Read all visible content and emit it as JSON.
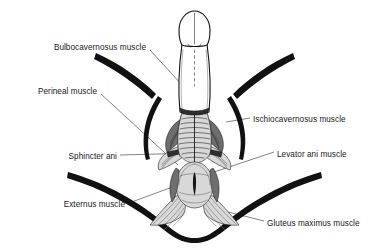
{
  "figure": {
    "background_color": "#ffffff",
    "ink_color": "#111111",
    "leader_color": "#2b2b2b",
    "width": 389,
    "height": 248
  },
  "labels": {
    "bulbocavernosus": "Bulbocavernosus muscle",
    "perineal": "Perineal muscle",
    "sphincter_ani": "Sphincter ani",
    "externus": "Externus muscle",
    "ischiocavernosus": "Ischiocavernosus muscle",
    "levator_ani": "Levator ani muscle",
    "gluteus_maximus": "Gluteus maximus muscle"
  },
  "label_list": [
    {
      "key": "bulbocavernosus",
      "text": "Bulbocavernosus muscle",
      "side": "left",
      "x": 146,
      "y": 47
    },
    {
      "key": "perineal",
      "text": "Perineal muscle",
      "side": "left",
      "x": 97,
      "y": 91
    },
    {
      "key": "sphincter_ani",
      "text": "Sphincter ani",
      "side": "left",
      "x": 117,
      "y": 157
    },
    {
      "key": "externus",
      "text": "Externus muscle",
      "side": "left",
      "x": 125,
      "y": 205
    },
    {
      "key": "ischiocavernosus",
      "text": "Ischiocavernosus muscle",
      "side": "right",
      "x": 253,
      "y": 120
    },
    {
      "key": "levator_ani",
      "text": "Levator ani muscle",
      "side": "right",
      "x": 277,
      "y": 155
    },
    {
      "key": "gluteus_maximus",
      "text": "Gluteus maximus muscle",
      "side": "right",
      "x": 267,
      "y": 224
    }
  ],
  "anatomy_parts": [
    "glans-penis",
    "penis-shaft",
    "bulbocavernosus-muscle",
    "ischiocavernosus-muscle",
    "superficial-transverse-perineal-muscle",
    "levator-ani-muscle",
    "external-anal-sphincter",
    "anus",
    "gluteus-maximus-muscle",
    "left-thigh-outline",
    "right-thigh-outline",
    "buttock-crease-outline"
  ]
}
